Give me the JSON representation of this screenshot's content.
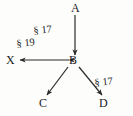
{
  "figure": {
    "type": "directed-graph-diagram",
    "background_color": "#fdfdfc",
    "stroke_color": "#2b2b2b",
    "text_color": "#1a1a1a",
    "width": 133,
    "height": 116
  },
  "nodes": [
    {
      "id": "A",
      "label": "A",
      "x": 75,
      "y": 9
    },
    {
      "id": "B",
      "label": "B",
      "x": 73,
      "y": 61
    },
    {
      "id": "X",
      "label": "X",
      "x": 12,
      "y": 61
    },
    {
      "id": "C",
      "label": "C",
      "x": 44,
      "y": 104
    },
    {
      "id": "D",
      "label": "D",
      "x": 104,
      "y": 104
    }
  ],
  "edges": [
    {
      "id": "A-B",
      "from": "A",
      "to": "B",
      "direction": "down",
      "arrowheads": "end",
      "label": "§ 17"
    },
    {
      "id": "B-X",
      "from": "B",
      "to": "X",
      "direction": "left",
      "arrowheads": "both",
      "label": "§ 19"
    },
    {
      "id": "B-C",
      "from": "B",
      "to": "C",
      "direction": "down-left",
      "arrowheads": "end",
      "label": ""
    },
    {
      "id": "B-D",
      "from": "B",
      "to": "D",
      "direction": "down-right",
      "arrowheads": "end",
      "label": "§ 17"
    }
  ],
  "edge_labels": [
    {
      "id": "label-17-top",
      "text": "§ 17",
      "x": 34,
      "y": 35
    },
    {
      "id": "label-19-left",
      "text": "§ 19",
      "x": 18,
      "y": 48
    },
    {
      "id": "label-17-right",
      "text": "§ 17",
      "x": 96,
      "y": 88
    }
  ]
}
